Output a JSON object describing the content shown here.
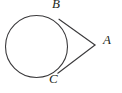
{
  "figure": {
    "background_color": "#ffffff",
    "stroke_color": "#3b3a3c",
    "label_color": "#231f20",
    "width": 122,
    "height": 93
  },
  "labels": {
    "point_b": "B",
    "point_c": "C",
    "point_a": "A"
  },
  "chart_data": {
    "type": "diagram",
    "xlabel": "",
    "ylabel": "",
    "xlim": [
      0,
      122
    ],
    "ylim": [
      0,
      93
    ],
    "grid": false,
    "legend": "none",
    "shapes": [
      {
        "name": "circle",
        "kind": "circle",
        "cx": 36.5,
        "cy": 46.5,
        "r": 31.0,
        "stroke": "#3b3a3c",
        "stroke_width": 1.1,
        "fill": "none"
      },
      {
        "name": "tangent-segment-b-a",
        "kind": "line",
        "x1": 59.0,
        "y1": 19.2,
        "x2": 95.0,
        "y2": 45.0,
        "stroke": "#3b3a3c",
        "stroke_width": 1.1
      },
      {
        "name": "tangent-segment-c-a",
        "kind": "line",
        "x1": 57.8,
        "y1": 73.2,
        "x2": 95.0,
        "y2": 45.0,
        "stroke": "#3b3a3c",
        "stroke_width": 1.1
      }
    ],
    "points": [
      {
        "name": "B",
        "label": "B",
        "x": 59.0,
        "y": 19.2,
        "role": "tangent point (upper)",
        "label_x": 56.0,
        "label_y": 8.0
      },
      {
        "name": "C",
        "label": "C",
        "x": 57.8,
        "y": 73.2,
        "role": "tangent point (lower)",
        "label_x": 53.0,
        "label_y": 83.0
      },
      {
        "name": "A",
        "label": "A",
        "x": 95.0,
        "y": 45.0,
        "role": "external apex",
        "label_x": 107.0,
        "label_y": 44.0
      }
    ]
  }
}
